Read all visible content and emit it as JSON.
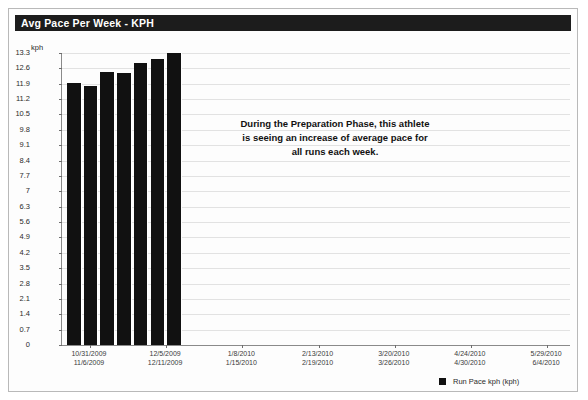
{
  "window": {
    "title": "Avg Pace Per Week - KPH"
  },
  "legend": {
    "label": "Run Pace kph (kph)",
    "swatch_color": "#111111",
    "position": "bottom-right"
  },
  "annotation": {
    "text": "During the Preparation Phase, this athlete is seeing an increase of average pace for all runs each week."
  },
  "chart_data": {
    "type": "bar",
    "title": "Avg Pace Per Week - KPH",
    "xlabel": "",
    "ylabel": "kph",
    "ylim": [
      0,
      13.3
    ],
    "grid": true,
    "bar_color": "#111111",
    "series": [
      {
        "name": "Run Pace kph (kph)",
        "values": [
          11.95,
          11.8,
          12.45,
          12.4,
          12.85,
          13.05,
          13.3
        ]
      }
    ],
    "categories": [
      "10/31/2009",
      "11/6/2009",
      "11/13/2009",
      "11/20/2009",
      "11/27/2009",
      "12/5/2009",
      "12/11/2009"
    ],
    "yticks": [
      "13.3",
      "12.6",
      "11.9",
      "11.2",
      "10.5",
      "9.8",
      "9.1",
      "8.4",
      "7.7",
      "7",
      "6.3",
      "5.6",
      "4.9",
      "4.2",
      "3.5",
      "2.8",
      "2.1",
      "1.4",
      "0.7",
      "0"
    ],
    "ytick_values": [
      13.3,
      12.6,
      11.9,
      11.2,
      10.5,
      9.8,
      9.1,
      8.4,
      7.7,
      7.0,
      6.3,
      5.6,
      4.9,
      4.2,
      3.5,
      2.8,
      2.1,
      1.4,
      0.7,
      0
    ],
    "xtick_labels": [
      {
        "top": "10/31/2009",
        "bottom": "11/6/2009",
        "x_frac": 0.055
      },
      {
        "top": "12/5/2009",
        "bottom": "12/11/2009",
        "x_frac": 0.205
      },
      {
        "top": "1/8/2010",
        "bottom": "1/15/2010",
        "x_frac": 0.355
      },
      {
        "top": "2/13/2010",
        "bottom": "2/19/2010",
        "x_frac": 0.505
      },
      {
        "top": "3/20/2010",
        "bottom": "3/26/2010",
        "x_frac": 0.655
      },
      {
        "top": "4/24/2010",
        "bottom": "4/30/2010",
        "x_frac": 0.805
      },
      {
        "top": "5/29/2010",
        "bottom": "6/4/2010",
        "x_frac": 0.955
      }
    ]
  }
}
